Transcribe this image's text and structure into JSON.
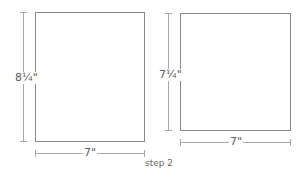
{
  "figures": [
    {
      "name": "panel-before",
      "height_label": "8¼\"",
      "width_label": "7\""
    },
    {
      "name": "panel-after",
      "height_label": "7¼\"",
      "width_label": "7\""
    }
  ],
  "caption": "step 2",
  "colors": {
    "outline": "#8a8a8a",
    "dimension": "#a8a8a8",
    "text": "#5a5a5a"
  }
}
